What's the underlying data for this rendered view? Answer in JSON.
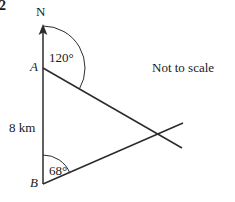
{
  "question": {
    "number": "2"
  },
  "diagram": {
    "type": "bearing-triangle",
    "note": "Not to scale",
    "north_label": "N",
    "vertices": [
      {
        "id": "A",
        "label": "A",
        "x": 43,
        "y": 68
      },
      {
        "id": "B",
        "label": "B",
        "x": 43,
        "y": 184
      }
    ],
    "north_arrow": {
      "from_x": 43,
      "from_y": 184,
      "to_x": 43,
      "to_y": 26
    },
    "angles": [
      {
        "at": "A",
        "label": "120°",
        "value": 120,
        "unit": "degrees",
        "from_direction": "north",
        "arc_radius": 42
      },
      {
        "at": "B",
        "label": "68°",
        "value": 68,
        "unit": "degrees",
        "from_direction": "north",
        "arc_radius": 29
      }
    ],
    "segments": [
      {
        "name": "AB",
        "label": "8 km",
        "length_value": 8,
        "length_unit": "km",
        "x1": 43,
        "y1": 68,
        "x2": 43,
        "y2": 184
      },
      {
        "name": "ray-from-A",
        "x1": 43,
        "y1": 68,
        "x2": 182,
        "y2": 148
      },
      {
        "name": "ray-from-B",
        "x1": 43,
        "y1": 184,
        "x2": 183,
        "y2": 123
      }
    ],
    "colors": {
      "ink": "#2b2b2b",
      "background": "#ffffff"
    }
  }
}
